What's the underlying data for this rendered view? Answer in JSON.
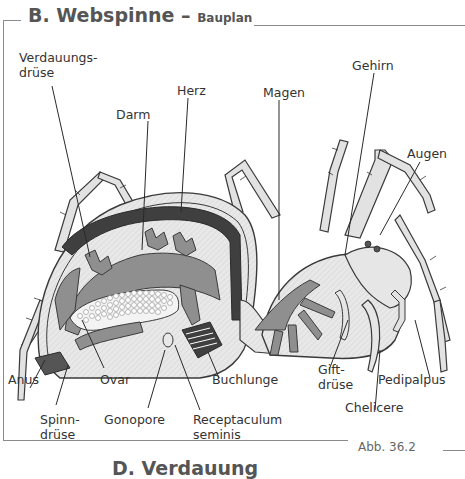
{
  "figure": {
    "title": "B. Webspinne",
    "title_separator": "–",
    "subtitle": "Bauplan",
    "caption": "Abb. 36.2",
    "next_section_title": "D. Verdauung"
  },
  "labels": {
    "verdauungsdruese_1": "Verdauungs-",
    "verdauungsdruese_2": "drüse",
    "herz": "Herz",
    "darm": "Darm",
    "magen": "Magen",
    "gehirn": "Gehirn",
    "augen": "Augen",
    "anus": "Anus",
    "ovar": "Ovar",
    "buchlunge": "Buchlunge",
    "giftdruese_1": "Gift-",
    "giftdruese_2": "drüse",
    "pedipalpus": "Pedipalpus",
    "spinndruese_1": "Spinn-",
    "spinndruese_2": "drüse",
    "gonopore": "Gonopore",
    "receptaculum_1": "Receptaculum",
    "receptaculum_2": "seminis",
    "chelicere": "Chelicere"
  },
  "colors": {
    "outline": "#3a3a3a",
    "body_light": "#e6e6e6",
    "organ_mid": "#8f8f8f",
    "heart_dark": "#3f3f3f",
    "leg_fill": "#e2e2e2",
    "frame": "#8a8a8a"
  }
}
